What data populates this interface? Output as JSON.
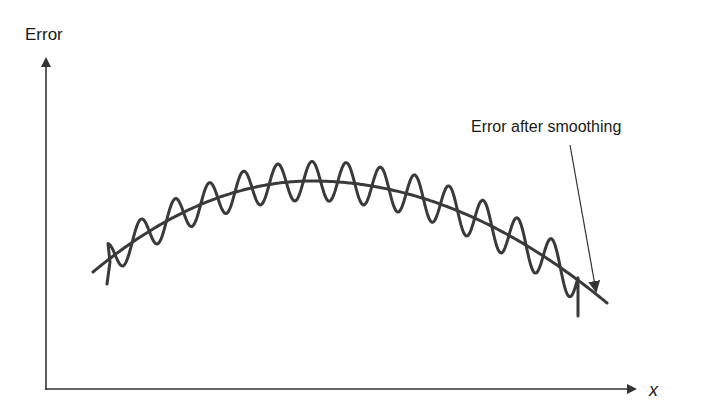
{
  "figure": {
    "y_axis_label": "Error",
    "x_axis_label": "x",
    "annotation": "Error after smoothing",
    "colors": {
      "curve": "#3a3a3a",
      "axis": "#333333",
      "text": "#1a1a1a",
      "background": "#ffffff"
    }
  },
  "chart_data": {
    "type": "line",
    "title": "",
    "xlabel": "x",
    "ylabel": "Error",
    "grid": false,
    "legend": "none",
    "annotations": [
      {
        "text": "Error after smoothing",
        "points_to": "smoothed-curve",
        "placement": "top-right"
      }
    ],
    "series": [
      {
        "name": "Error after smoothing",
        "description": "smooth concave-down curve",
        "x": [
          0.08,
          0.2,
          0.3,
          0.45,
          0.6,
          0.75,
          0.9,
          0.96
        ],
        "values": [
          0.36,
          0.5,
          0.57,
          0.62,
          0.58,
          0.47,
          0.3,
          0.26
        ]
      },
      {
        "name": "Error (unsmoothed)",
        "description": "oscillating curve around the smoothed trend, approx. 14 oscillations",
        "oscillations": 14,
        "trend": "Error after smoothing"
      }
    ]
  }
}
